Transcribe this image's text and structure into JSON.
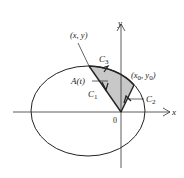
{
  "figure": {
    "type": "ellipse-sector-area-diagram",
    "axes": {
      "x_label": "x",
      "y_label": "y",
      "origin_label": "0"
    },
    "points": {
      "moving_point": {
        "label": "(x, y)"
      },
      "fixed_point": {
        "label_main": "(x",
        "label_sub0": "0",
        "label_mid": ", y",
        "label_sub1": "0",
        "label_end": ")"
      }
    },
    "curves": {
      "c1": {
        "label": "C",
        "sub": "1"
      },
      "c2": {
        "label": "C",
        "sub": "2"
      },
      "c3": {
        "label": "C",
        "sub": "3"
      }
    },
    "area": {
      "label": "A(t)"
    },
    "colors": {
      "stroke": "#222222",
      "shade": "#c8c8c8",
      "axis": "#333333"
    }
  }
}
